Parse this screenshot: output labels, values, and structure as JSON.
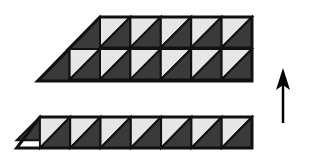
{
  "figure": {
    "colors": {
      "dark": "#3a3a3a",
      "light": "#e6e6e6",
      "stroke": "#111111",
      "background": "#ffffff"
    },
    "top_shape": {
      "rows": 2,
      "row1_cells": 5,
      "row2_cells": 6,
      "cell_size": 30.4,
      "x_right": 252,
      "y_top": 17,
      "y_bottom": 81
    },
    "bottom_shape": {
      "rows": 1,
      "cells": 7,
      "cell_size": 30.3,
      "x_right": 252,
      "y_top": 117,
      "y_bottom": 148
    },
    "arrow": {
      "direction": "up",
      "x": 283,
      "y_tip": 68,
      "y_tail": 123
    }
  }
}
